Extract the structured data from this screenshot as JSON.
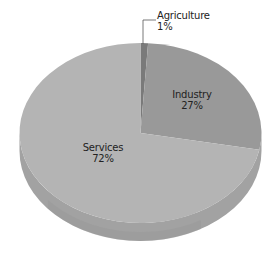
{
  "chart_data": {
    "type": "pie",
    "title": "",
    "style": "3d-tilted",
    "start_angle_deg": 0,
    "direction": "clockwise",
    "slices": [
      {
        "label": "Agriculture",
        "value": 1,
        "value_label": "1%",
        "color": "#7a7a7a",
        "label_position": "outside-leader-line"
      },
      {
        "label": "Industry",
        "value": 27,
        "value_label": "27%",
        "color": "#999999",
        "label_position": "inside"
      },
      {
        "label": "Services",
        "value": 72,
        "value_label": "72%",
        "color": "#b4b4b4",
        "label_position": "inside"
      }
    ],
    "legend": "none"
  },
  "labels": {
    "agriculture": {
      "name": "Agriculture",
      "pct": "1%"
    },
    "industry": {
      "name": "Industry",
      "pct": "27%"
    },
    "services": {
      "name": "Services",
      "pct": "72%"
    }
  },
  "colors": {
    "side": "#a2a2a2",
    "side_dark": "#959595",
    "leader": "#555555"
  }
}
